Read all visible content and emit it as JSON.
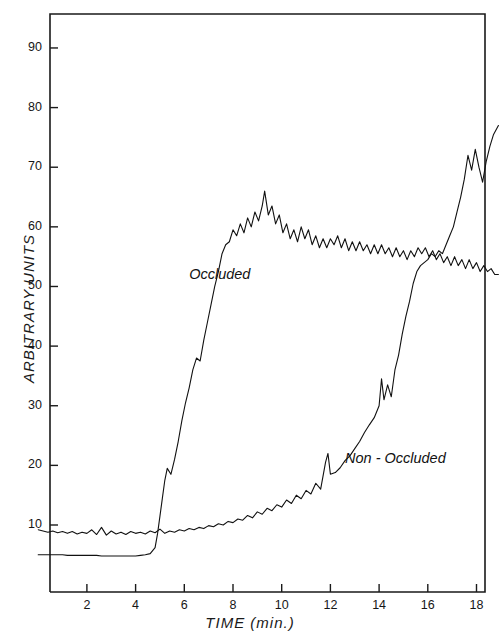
{
  "chart_data": {
    "type": "line",
    "title": "",
    "xlabel": "TIME  (min.)",
    "ylabel": "ARBITRARY  UNITS",
    "xlim": [
      0,
      18.9
    ],
    "ylim": [
      0,
      95
    ],
    "xticks": [
      2,
      4,
      6,
      8,
      10,
      12,
      14,
      16,
      18
    ],
    "yticks": [
      10,
      20,
      30,
      40,
      50,
      60,
      70,
      80,
      90
    ],
    "grid": false,
    "legend_position": "inline-annotation",
    "line_color": "#111111",
    "line_width": 1.1,
    "series": [
      {
        "name": "Occluded",
        "annotation": "Occluded",
        "annotation_x": 6.2,
        "annotation_y": 52,
        "x": [
          0.0,
          0.2,
          0.4,
          0.6,
          0.8,
          1.0,
          1.2,
          1.4,
          1.6,
          1.8,
          2.0,
          2.2,
          2.4,
          2.6,
          2.8,
          3.0,
          3.2,
          3.4,
          3.6,
          3.8,
          4.0,
          4.2,
          4.4,
          4.6,
          4.8,
          4.9,
          5.0,
          5.1,
          5.2,
          5.3,
          5.45,
          5.6,
          5.75,
          5.9,
          6.05,
          6.2,
          6.35,
          6.5,
          6.65,
          6.8,
          6.95,
          7.1,
          7.25,
          7.4,
          7.55,
          7.7,
          7.85,
          8.0,
          8.15,
          8.3,
          8.45,
          8.6,
          8.75,
          8.9,
          9.05,
          9.2,
          9.3,
          9.45,
          9.6,
          9.75,
          9.9,
          10.05,
          10.2,
          10.35,
          10.5,
          10.65,
          10.8,
          10.95,
          11.1,
          11.25,
          11.4,
          11.55,
          11.7,
          11.85,
          12.0,
          12.15,
          12.3,
          12.45,
          12.6,
          12.75,
          12.9,
          13.05,
          13.2,
          13.35,
          13.5,
          13.65,
          13.8,
          13.95,
          14.1,
          14.25,
          14.4,
          14.55,
          14.7,
          14.85,
          15.0,
          15.15,
          15.3,
          15.45,
          15.6,
          15.75,
          15.9,
          16.05,
          16.2,
          16.35,
          16.5,
          16.65,
          16.8,
          16.95,
          17.1,
          17.25,
          17.4,
          17.55,
          17.7,
          17.85,
          18.0,
          18.15,
          18.3,
          18.45,
          18.6,
          18.75,
          18.9
        ],
        "y": [
          5.0,
          5.0,
          5.0,
          5.0,
          5.0,
          5.0,
          4.9,
          4.9,
          4.9,
          4.9,
          4.9,
          4.9,
          4.9,
          4.8,
          4.8,
          4.8,
          4.8,
          4.8,
          4.8,
          4.8,
          4.8,
          4.9,
          5.0,
          5.2,
          6.2,
          8.5,
          11.5,
          14.5,
          17.5,
          19.5,
          18.5,
          21.0,
          24.0,
          27.5,
          30.5,
          33.0,
          36.0,
          38.0,
          37.5,
          41.0,
          44.0,
          47.0,
          50.0,
          52.5,
          55.5,
          57.0,
          57.5,
          59.5,
          58.5,
          60.5,
          59.0,
          61.5,
          60.0,
          62.5,
          61.0,
          63.5,
          66.0,
          62.0,
          63.5,
          60.5,
          62.0,
          59.0,
          60.5,
          58.0,
          59.5,
          57.5,
          60.0,
          58.0,
          59.5,
          57.0,
          58.5,
          56.5,
          58.0,
          56.5,
          58.0,
          57.0,
          58.5,
          56.5,
          58.0,
          56.0,
          57.5,
          56.0,
          57.5,
          56.0,
          57.0,
          55.5,
          57.0,
          55.5,
          57.0,
          55.5,
          56.5,
          55.0,
          56.5,
          55.0,
          56.0,
          54.5,
          56.0,
          55.0,
          56.5,
          55.5,
          56.5,
          55.0,
          56.0,
          54.5,
          55.5,
          54.0,
          55.0,
          53.5,
          55.0,
          53.5,
          54.5,
          53.0,
          54.5,
          53.0,
          54.0,
          52.5,
          53.5,
          52.5,
          53.0,
          52.0,
          52.0
        ]
      },
      {
        "name": "Non - Occluded",
        "annotation": "Non - Occluded",
        "annotation_x": 12.6,
        "annotation_y": 21,
        "x": [
          0.0,
          0.2,
          0.4,
          0.6,
          0.8,
          1.0,
          1.2,
          1.4,
          1.6,
          1.8,
          2.0,
          2.2,
          2.4,
          2.6,
          2.8,
          3.0,
          3.2,
          3.4,
          3.6,
          3.8,
          4.0,
          4.2,
          4.4,
          4.6,
          4.8,
          5.0,
          5.2,
          5.4,
          5.6,
          5.8,
          6.0,
          6.2,
          6.4,
          6.6,
          6.8,
          7.0,
          7.2,
          7.4,
          7.6,
          7.8,
          8.0,
          8.2,
          8.4,
          8.6,
          8.8,
          9.0,
          9.2,
          9.4,
          9.6,
          9.8,
          10.0,
          10.2,
          10.4,
          10.6,
          10.8,
          11.0,
          11.2,
          11.4,
          11.6,
          11.8,
          11.9,
          12.0,
          12.2,
          12.4,
          12.6,
          12.8,
          13.0,
          13.2,
          13.4,
          13.6,
          13.8,
          14.0,
          14.1,
          14.2,
          14.35,
          14.5,
          14.65,
          14.8,
          14.95,
          15.1,
          15.25,
          15.4,
          15.55,
          15.7,
          15.85,
          16.0,
          16.15,
          16.3,
          16.45,
          16.6,
          16.75,
          16.9,
          17.05,
          17.2,
          17.35,
          17.5,
          17.65,
          17.8,
          17.95,
          18.1,
          18.25,
          18.4,
          18.55,
          18.7,
          18.9
        ],
        "y": [
          9.2,
          9.0,
          8.8,
          9.0,
          8.7,
          8.9,
          8.6,
          8.9,
          8.5,
          8.8,
          8.6,
          9.2,
          8.4,
          9.6,
          8.3,
          9.0,
          8.5,
          8.8,
          8.4,
          8.9,
          8.6,
          8.8,
          8.5,
          9.0,
          8.7,
          9.3,
          8.6,
          9.0,
          8.8,
          9.2,
          9.0,
          9.4,
          9.2,
          9.6,
          9.4,
          9.9,
          9.7,
          10.2,
          10.0,
          10.6,
          10.4,
          11.0,
          10.8,
          11.6,
          11.2,
          12.2,
          11.8,
          12.8,
          12.4,
          13.4,
          13.0,
          14.2,
          13.6,
          15.0,
          14.4,
          15.8,
          15.2,
          17.0,
          16.0,
          20.5,
          22.0,
          18.5,
          18.8,
          19.6,
          20.8,
          21.6,
          22.8,
          24.0,
          25.5,
          26.8,
          28.0,
          30.0,
          34.5,
          31.0,
          33.5,
          31.5,
          36.0,
          38.5,
          42.0,
          45.0,
          47.5,
          50.5,
          52.5,
          53.5,
          54.0,
          54.5,
          55.5,
          55.0,
          56.0,
          55.5,
          57.0,
          58.5,
          60.0,
          62.5,
          65.0,
          68.0,
          72.0,
          69.5,
          73.0,
          70.0,
          67.5,
          71.0,
          73.5,
          75.5,
          77.0
        ]
      }
    ]
  },
  "axes": {
    "x_tick_labels": [
      "2",
      "4",
      "6",
      "8",
      "10",
      "12",
      "14",
      "16",
      "18"
    ],
    "y_tick_labels": [
      "10",
      "20",
      "30",
      "40",
      "50",
      "60",
      "70",
      "80",
      "90"
    ],
    "x_axis_title": "TIME  (min.)",
    "y_axis_title": "ARBITRARY  UNITS"
  },
  "annotations": {
    "occluded": "Occluded",
    "non_occluded": "Non - Occluded"
  },
  "colors": {
    "line": "#111111",
    "frame": "#1a1a1a",
    "background": "#ffffff",
    "text": "#161616"
  }
}
